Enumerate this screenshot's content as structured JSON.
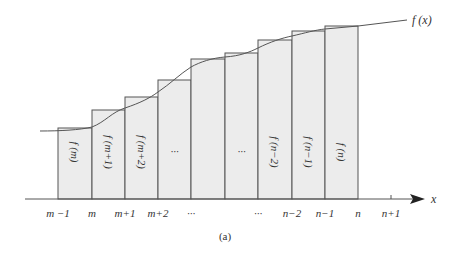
{
  "figure": {
    "caption": "(a)",
    "curve_label": "f (x)",
    "axis_label": "x",
    "colors": {
      "bar_fill": "#ececec",
      "stroke": "#555555",
      "text": "#333333",
      "background": "#ffffff"
    }
  },
  "x_ticks": [
    {
      "label": "m −1",
      "x": 58
    },
    {
      "label": "m",
      "x": 92
    },
    {
      "label": "m+1",
      "x": 125
    },
    {
      "label": "m+2",
      "x": 158
    },
    {
      "label": "···",
      "x": 191
    },
    {
      "label": "···",
      "x": 258
    },
    {
      "label": "n−2",
      "x": 292
    },
    {
      "label": "n−1",
      "x": 325
    },
    {
      "label": "n",
      "x": 358
    },
    {
      "label": "n+1",
      "x": 391
    }
  ],
  "bars": [
    {
      "label": "f (m)",
      "x0": 58,
      "x1": 92,
      "top": 128
    },
    {
      "label": "f (m+1)",
      "x0": 92,
      "x1": 125,
      "top": 110
    },
    {
      "label": "f (m+2)",
      "x0": 125,
      "x1": 158,
      "top": 97
    },
    {
      "label": "···",
      "x0": 158,
      "x1": 191,
      "top": 80
    },
    {
      "label": "",
      "x0": 191,
      "x1": 225,
      "top": 59
    },
    {
      "label": "···",
      "x0": 225,
      "x1": 258,
      "top": 53
    },
    {
      "label": "f (n−2)",
      "x0": 258,
      "x1": 292,
      "top": 40
    },
    {
      "label": "f (n−1)",
      "x0": 292,
      "x1": 325,
      "top": 31
    },
    {
      "label": "f (n)",
      "x0": 325,
      "x1": 358,
      "top": 26
    }
  ]
}
